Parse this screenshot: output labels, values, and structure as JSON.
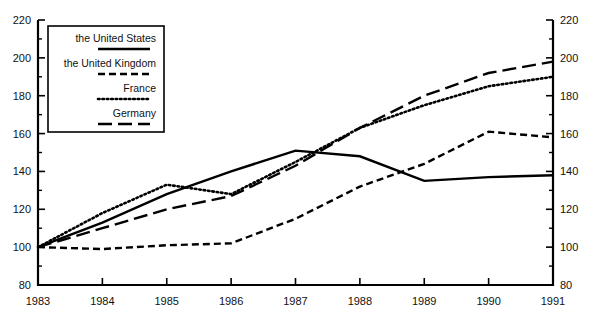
{
  "chart_data": {
    "type": "line",
    "title": "",
    "subtitle": "",
    "xlabel": "",
    "ylabel": "",
    "x": [
      1983,
      1984,
      1985,
      1986,
      1987,
      1988,
      1989,
      1990,
      1991
    ],
    "xlim": [
      1983,
      1991
    ],
    "ylim": [
      80,
      220
    ],
    "y_major_ticks": [
      80,
      100,
      120,
      140,
      160,
      180,
      200,
      220
    ],
    "y_minor_ticks": [
      90,
      110,
      130,
      150,
      170,
      190,
      210
    ],
    "x_tick_labels": [
      "1983",
      "1984",
      "1985",
      "1986",
      "1987",
      "1988",
      "1989",
      "1990",
      "1991"
    ],
    "y_tick_labels_left": [
      "220",
      "200",
      "180",
      "160",
      "140",
      "120",
      "100",
      "80"
    ],
    "y_tick_labels_right": [
      "220",
      "200",
      "180",
      "160",
      "140",
      "120",
      "100",
      "80"
    ],
    "grid": false,
    "dual_y_axis": true,
    "legend_position": "upper-left-inside",
    "series": [
      {
        "name": "the United States",
        "style": "solid",
        "color": "#000000",
        "dasharray": "none",
        "values": [
          100,
          113,
          128,
          140,
          151,
          148,
          135,
          137,
          138
        ]
      },
      {
        "name": "the United Kingdom",
        "style": "dashed",
        "color": "#000000",
        "dasharray": "7,4",
        "values": [
          100,
          99,
          101,
          102,
          115,
          132,
          144,
          161,
          158
        ]
      },
      {
        "name": "France",
        "style": "dotted",
        "color": "#000000",
        "dasharray": "1.6,2.8",
        "values": [
          100,
          118,
          133,
          128,
          145,
          163,
          175,
          185,
          190
        ]
      },
      {
        "name": "Germany",
        "style": "long-dash",
        "color": "#000000",
        "dasharray": "14,6",
        "values": [
          100,
          110,
          120,
          127,
          143,
          163,
          180,
          192,
          198
        ]
      }
    ]
  },
  "legend": {
    "entries": [
      {
        "label": "the United States"
      },
      {
        "label": "the United Kingdom"
      },
      {
        "label": "France"
      },
      {
        "label": "Germany"
      }
    ]
  }
}
